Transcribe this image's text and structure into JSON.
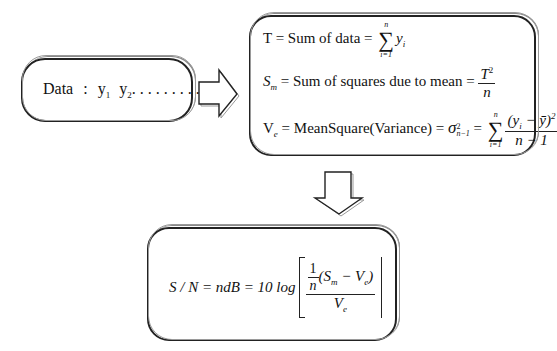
{
  "input_box": {
    "label": "Data",
    "separator": ":",
    "y1": "y",
    "y1_sub": "1",
    "y2": "y",
    "y2_sub": "2",
    "dots": ". . . . . . . . .",
    "yn": "y",
    "yn_sub": "n"
  },
  "stats_box": {
    "total": {
      "lhs": "T = Sum of data = ",
      "sigma_upper": "n",
      "sigma_lower": "i=1",
      "term": "y",
      "term_sub": "i"
    },
    "sm": {
      "lhs_symbol": "S",
      "lhs_sub": "m",
      "text": " = Sum of squares due to mean = ",
      "num": "T",
      "num_sup": "2",
      "den": "n"
    },
    "ve": {
      "lhs_symbol": "V",
      "lhs_sub": "e",
      "text": " = MeanSquare(Variance) = ",
      "sigma_symbol": "σ",
      "sigma_sup": "2",
      "sigma_sub": "n−1",
      "eq": " = ",
      "sigma_upper": "n",
      "sigma_lower": "i=1",
      "num": "(y",
      "num_sub": "i",
      "num_rest": " − ȳ)",
      "num_sup": "2",
      "den": "n − 1"
    }
  },
  "sn_box": {
    "lhs": "S / N = ndB = 10 log",
    "inner_one": "1",
    "inner_n": "n",
    "inner_expr_open": "(S",
    "inner_sm_sub": "m",
    "inner_minus": " − V",
    "inner_ve_sub": "e",
    "inner_close": ")",
    "den": "V",
    "den_sub": "e"
  },
  "arrows": {
    "right": "arrow-right",
    "down": "arrow-down"
  }
}
